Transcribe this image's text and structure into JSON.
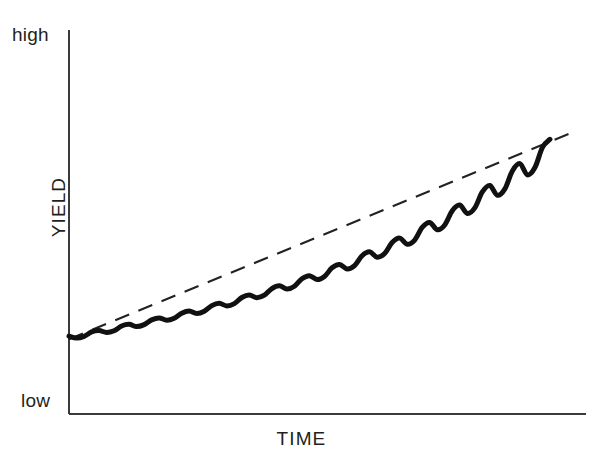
{
  "figure": {
    "background_color": "#ffffff",
    "ink_color": "#231f20",
    "axis_color": "#3a3a3a",
    "width": 603,
    "height": 471
  },
  "labels": {
    "y_axis_title": "YIELD",
    "x_axis_title": "TIME",
    "y_top_tick": "high",
    "y_bottom_tick": "low"
  },
  "axes": {
    "x_origin": 69,
    "y_origin": 414,
    "x_end": 586,
    "y_top": 30,
    "line_width": 2
  },
  "chart_data": {
    "type": "line",
    "title": "",
    "xlabel": "TIME",
    "ylabel": "YIELD",
    "xlim": [
      0,
      100
    ],
    "ylim": [
      0,
      100
    ],
    "xticks": [],
    "yticks": [
      0,
      100
    ],
    "ytick_labels": [
      "low",
      "high"
    ],
    "grid": false,
    "legend": "none",
    "series": [
      {
        "name": "yield",
        "style": "solid-thick",
        "color": "#111111",
        "line_width": 5,
        "x": [
          0,
          1.5,
          3,
          4.5,
          6,
          7.5,
          9,
          10.5,
          12,
          13.5,
          15,
          16.5,
          18,
          19.5,
          21,
          22.5,
          24,
          25.5,
          27,
          28.5,
          30,
          31.5,
          33,
          34.5,
          36,
          37.5,
          39,
          40.5,
          42,
          43.5,
          45,
          46.5,
          48,
          49.5,
          51,
          52.5,
          54,
          55.5,
          57,
          58.5,
          60,
          61.5,
          63,
          64.5,
          66,
          67.5,
          69,
          70.5,
          72,
          73.5,
          75,
          76.5,
          78,
          79.5,
          81,
          82.5,
          84,
          85.5,
          87,
          88.5,
          90,
          91.5,
          93,
          94.5,
          96
        ],
        "y": [
          12.1,
          11.4,
          12.0,
          13.6,
          14.1,
          13.4,
          14.0,
          15.7,
          16.3,
          15.5,
          16.2,
          17.9,
          18.6,
          17.8,
          18.5,
          20.3,
          21.1,
          20.2,
          21.0,
          23.0,
          23.8,
          22.9,
          23.7,
          25.9,
          26.8,
          25.8,
          26.7,
          29.1,
          30.1,
          28.9,
          29.9,
          32.6,
          33.7,
          32.3,
          33.4,
          36.5,
          37.7,
          36.1,
          37.3,
          40.8,
          42.2,
          40.3,
          41.6,
          45.5,
          47.1,
          44.9,
          46.4,
          50.9,
          52.7,
          50.1,
          51.8,
          56.9,
          58.9,
          55.9,
          57.9,
          63.6,
          65.9,
          62.4,
          64.7,
          71.1,
          73.7,
          69.7,
          72.3,
          79.5,
          82.4
        ]
      },
      {
        "name": "trend",
        "style": "dashed",
        "color": "#222222",
        "line_width": 2,
        "dash_pattern": [
          15,
          10
        ],
        "x": [
          0,
          100
        ],
        "y": [
          11.0,
          84.5
        ]
      }
    ]
  }
}
